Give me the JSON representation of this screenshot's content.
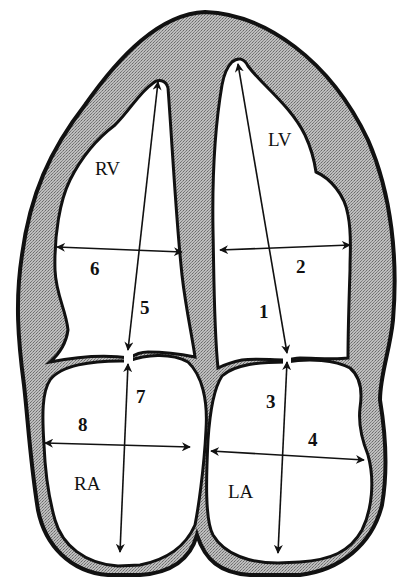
{
  "diagram": {
    "colors": {
      "myocardium": "#a8a8a8",
      "outline": "#111111",
      "cavity": "#ffffff",
      "background": "#ffffff"
    },
    "chambers": [
      {
        "id": "RV",
        "label": "RV",
        "name": "Right ventricle"
      },
      {
        "id": "LV",
        "label": "LV",
        "name": "Left ventricle"
      },
      {
        "id": "RA",
        "label": "RA",
        "name": "Right atrium"
      },
      {
        "id": "LA",
        "label": "LA",
        "name": "Left atrium"
      }
    ],
    "measurements": [
      {
        "label": "1",
        "chamber": "LV",
        "orientation": "long-axis"
      },
      {
        "label": "2",
        "chamber": "LV",
        "orientation": "short-axis"
      },
      {
        "label": "3",
        "chamber": "LA",
        "orientation": "long-axis"
      },
      {
        "label": "4",
        "chamber": "LA",
        "orientation": "short-axis"
      },
      {
        "label": "5",
        "chamber": "RV",
        "orientation": "long-axis"
      },
      {
        "label": "6",
        "chamber": "RV",
        "orientation": "short-axis"
      },
      {
        "label": "7",
        "chamber": "RA",
        "orientation": "long-axis"
      },
      {
        "label": "8",
        "chamber": "RA",
        "orientation": "short-axis"
      }
    ]
  }
}
